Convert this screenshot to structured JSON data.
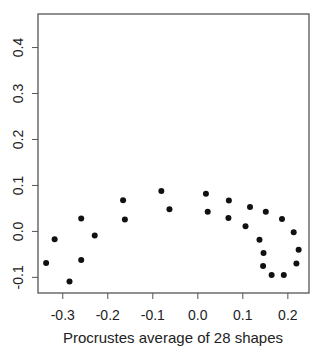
{
  "chart_data": {
    "type": "scatter",
    "title": "",
    "xlabel": "Procrustes average of 28 shapes",
    "ylabel": "",
    "xlim": [
      -0.355,
      0.247
    ],
    "ylim": [
      -0.134,
      0.473
    ],
    "grid": false,
    "legend": null,
    "x_ticks": [
      -0.3,
      -0.2,
      -0.1,
      0.0,
      0.1,
      0.2
    ],
    "x_tick_labels": [
      "-0.3",
      "-0.2",
      "-0.1",
      "0.0",
      "0.1",
      "0.2"
    ],
    "y_ticks": [
      -0.1,
      0.0,
      0.1,
      0.2,
      0.3,
      0.4
    ],
    "y_tick_labels": [
      "-0.1",
      "0.0",
      "0.1",
      "0.2",
      "0.3",
      "0.4"
    ],
    "points": [
      {
        "x": -0.337,
        "y": -0.069
      },
      {
        "x": -0.318,
        "y": -0.017
      },
      {
        "x": -0.285,
        "y": -0.109
      },
      {
        "x": -0.259,
        "y": 0.028
      },
      {
        "x": -0.259,
        "y": -0.062
      },
      {
        "x": -0.229,
        "y": -0.009
      },
      {
        "x": -0.166,
        "y": 0.068
      },
      {
        "x": -0.162,
        "y": 0.026
      },
      {
        "x": -0.081,
        "y": 0.088
      },
      {
        "x": -0.063,
        "y": 0.048
      },
      {
        "x": 0.018,
        "y": 0.082
      },
      {
        "x": 0.022,
        "y": 0.043
      },
      {
        "x": 0.069,
        "y": 0.067
      },
      {
        "x": 0.068,
        "y": 0.029
      },
      {
        "x": 0.116,
        "y": 0.053
      },
      {
        "x": 0.106,
        "y": 0.011
      },
      {
        "x": 0.151,
        "y": 0.043
      },
      {
        "x": 0.187,
        "y": 0.027
      },
      {
        "x": 0.137,
        "y": -0.018
      },
      {
        "x": 0.213,
        "y": -0.002
      },
      {
        "x": 0.146,
        "y": -0.047
      },
      {
        "x": 0.224,
        "y": -0.04
      },
      {
        "x": 0.145,
        "y": -0.075
      },
      {
        "x": 0.219,
        "y": -0.07
      },
      {
        "x": 0.164,
        "y": -0.095
      },
      {
        "x": 0.191,
        "y": -0.095
      }
    ]
  },
  "colors": {
    "point": "#111111",
    "axis": "#555555",
    "text": "#222222"
  }
}
